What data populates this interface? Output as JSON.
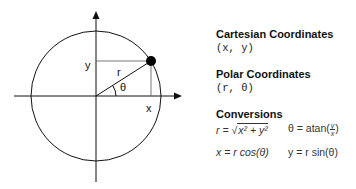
{
  "diagram": {
    "labels": {
      "y": "y",
      "r": "r",
      "theta": "θ",
      "x": "x"
    }
  },
  "panel": {
    "cartesian": {
      "title": "Cartesian Coordinates",
      "notation": "(x, y)"
    },
    "polar": {
      "title": "Polar Coordinates",
      "notation": "(r, θ)"
    },
    "conversions": {
      "title": "Conversions",
      "r_lhs": "r = ",
      "r_rad": "x² + y²",
      "theta_lhs": "θ = atan(",
      "theta_num": "y",
      "theta_den": "x",
      "theta_rhs": ")",
      "x_eq": "x =  r cos(θ)",
      "y_eq": "y = r sin(θ)"
    }
  }
}
